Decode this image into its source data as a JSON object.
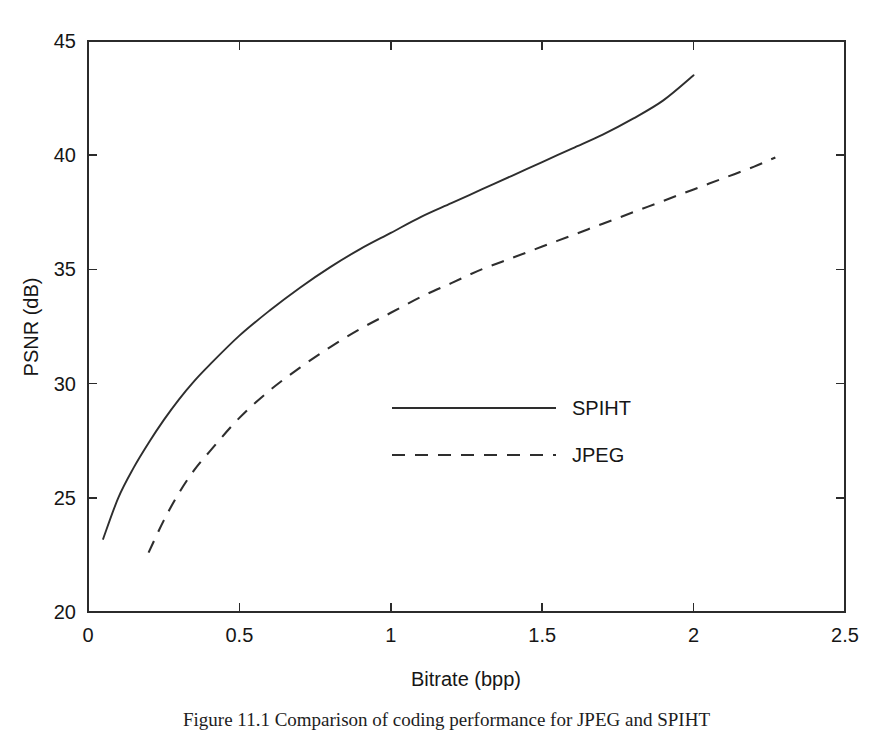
{
  "figure": {
    "caption": "Figure 11.1 Comparison of coding performance for JPEG and SPIHT"
  },
  "chart_data": {
    "type": "line",
    "title": "",
    "xlabel": "Bitrate (bpp)",
    "ylabel": "PSNR (dB)",
    "xlim": [
      0,
      2.5
    ],
    "ylim": [
      20,
      45
    ],
    "xticks": [
      "0",
      "0.5",
      "1",
      "1.5",
      "2",
      "2.5"
    ],
    "xtick_values": [
      0,
      0.5,
      1,
      1.5,
      2,
      2.5
    ],
    "yticks": [
      "20",
      "25",
      "30",
      "35",
      "40",
      "45"
    ],
    "ytick_values": [
      20,
      25,
      30,
      35,
      40,
      45
    ],
    "grid": false,
    "legend_position": "center",
    "series": [
      {
        "name": "SPIHT",
        "style": "solid",
        "color": "#2e2e2e",
        "x": [
          0.05,
          0.1,
          0.15,
          0.2,
          0.25,
          0.3,
          0.35,
          0.4,
          0.5,
          0.6,
          0.7,
          0.8,
          0.9,
          1.0,
          1.1,
          1.2,
          1.3,
          1.4,
          1.5,
          1.6,
          1.7,
          1.8,
          1.9,
          2.0
        ],
        "y": [
          23.2,
          25.0,
          26.3,
          27.4,
          28.4,
          29.3,
          30.1,
          30.8,
          32.1,
          33.2,
          34.2,
          35.1,
          35.9,
          36.6,
          37.3,
          37.9,
          38.5,
          39.1,
          39.7,
          40.3,
          40.9,
          41.6,
          42.4,
          43.5
        ]
      },
      {
        "name": "JPEG",
        "style": "dashed",
        "color": "#2e2e2e",
        "x": [
          0.2,
          0.25,
          0.3,
          0.35,
          0.4,
          0.5,
          0.6,
          0.7,
          0.8,
          0.9,
          1.0,
          1.1,
          1.2,
          1.3,
          1.4,
          1.5,
          1.6,
          1.7,
          1.8,
          1.9,
          2.0,
          2.1,
          2.2,
          2.27
        ],
        "y": [
          22.6,
          24.0,
          25.2,
          26.2,
          27.0,
          28.5,
          29.7,
          30.7,
          31.6,
          32.4,
          33.1,
          33.8,
          34.4,
          35.0,
          35.5,
          36.0,
          36.5,
          37.0,
          37.5,
          38.0,
          38.5,
          39.0,
          39.5,
          39.9
        ]
      }
    ],
    "legend": [
      {
        "label": "SPIHT",
        "style": "solid"
      },
      {
        "label": "JPEG",
        "style": "dashed"
      }
    ]
  }
}
